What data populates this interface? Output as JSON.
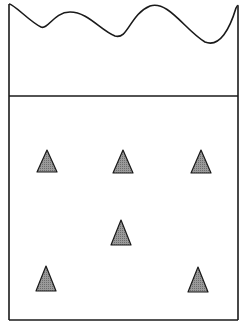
{
  "diagram": {
    "colors": {
      "stroke": "#1a1a1a",
      "particle_fill": "#8a8a8a",
      "background": "#ffffff"
    },
    "container": {
      "left": 9,
      "right": 238,
      "top_left": 4,
      "top_right": 6,
      "bottom": 320,
      "divider_y": 96
    },
    "wave_path": "M9,4 C14,4 30,22 41,27 C48,30 54,12 70,12 C88,12 100,30 115,36 C128,40 130,14 150,6 C168,0 185,30 205,42 C220,48 230,28 236,8 C238,4 238,6 238,6",
    "particles": [
      {
        "id": "p1",
        "x": 47,
        "y_top": 150,
        "y_base": 172,
        "half_width": 10
      },
      {
        "id": "p2",
        "x": 123,
        "y_top": 150,
        "y_base": 173,
        "half_width": 10
      },
      {
        "id": "p3",
        "x": 201,
        "y_top": 150,
        "y_base": 173,
        "half_width": 10
      },
      {
        "id": "p4",
        "x": 121,
        "y_top": 220,
        "y_base": 245,
        "half_width": 10
      },
      {
        "id": "p5",
        "x": 46,
        "y_top": 266,
        "y_base": 291,
        "half_width": 10
      },
      {
        "id": "p6",
        "x": 198,
        "y_top": 267,
        "y_base": 292,
        "half_width": 10
      }
    ]
  }
}
